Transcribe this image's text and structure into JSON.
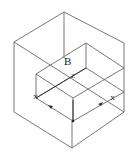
{
  "diagram": {
    "type": "isometric-wireframe",
    "labels": {
      "region": "B",
      "axis_z": "Z",
      "axis_x_left": "X",
      "axis_x_right": "X"
    },
    "colors": {
      "line": "#555555",
      "axis": "#333333",
      "background": "#ffffff"
    }
  }
}
